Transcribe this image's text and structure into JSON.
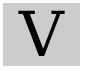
{
  "tile": {
    "letter": "V",
    "background_color": "#cccccc",
    "letter_color": "#000000"
  }
}
